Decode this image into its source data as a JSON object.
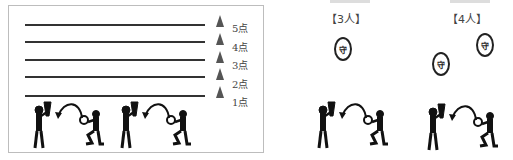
{
  "left_panel": {
    "score_levels": [
      {
        "label": "5点",
        "y": 24
      },
      {
        "label": "4点",
        "y": 41
      },
      {
        "label": "3点",
        "y": 59
      },
      {
        "label": "2点",
        "y": 76
      },
      {
        "label": "1点",
        "y": 95
      }
    ],
    "line_color": "#333333",
    "cone_color": "#555555"
  },
  "right_panel": {
    "groups": [
      {
        "label": "【3人】",
        "defender_label": "守"
      },
      {
        "label": "【4人】",
        "defender_label": "守"
      }
    ]
  }
}
